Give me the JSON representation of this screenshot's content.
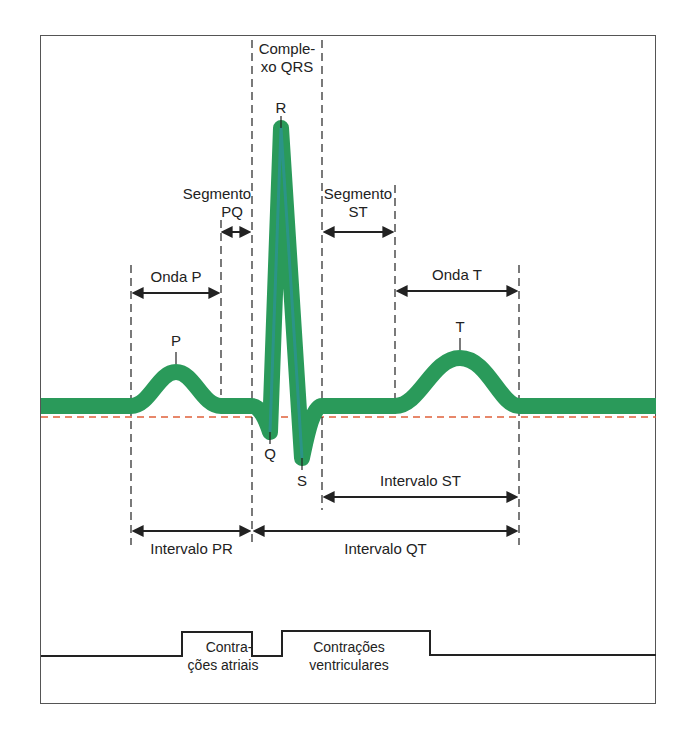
{
  "diagram": {
    "colors": {
      "trace": "#2a9a5a",
      "trace_edge": "#2b8fae",
      "baseline": "#e0603a",
      "lines": "#222222",
      "frame": "#555555"
    },
    "labels": {
      "qrs_complex_line1": "Comple-",
      "qrs_complex_line2": "xo QRS",
      "peak_r": "R",
      "peak_p": "P",
      "peak_q": "Q",
      "peak_s": "S",
      "peak_t": "T",
      "segment_pq_line1": "Segmento",
      "segment_pq_line2": "PQ",
      "segment_st_line1": "Segmento",
      "segment_st_line2": "ST",
      "wave_p": "Onda P",
      "wave_t": "Onda T",
      "interval_st": "Intervalo ST",
      "interval_pr": "Intervalo PR",
      "interval_qt": "Intervalo QT",
      "atrial_contractions_line1": "Contra-",
      "atrial_contractions_line2": "ções atriais",
      "ventricular_contractions_line1": "Contrações",
      "ventricular_contractions_line2": "ventriculares"
    }
  }
}
